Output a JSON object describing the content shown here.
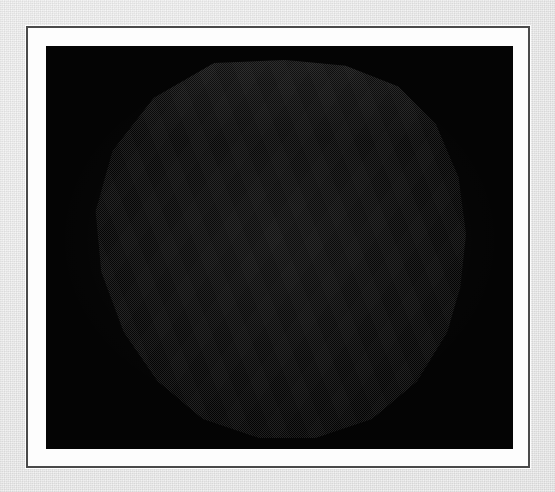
{
  "page": {
    "background_color": "#e9e9e9",
    "medium": "scanned paper plate"
  },
  "plate": {
    "frame_color": "#4a4a4a",
    "matte_color": "#fdfdfd",
    "panel_color": "#040404",
    "frame_rect": {
      "x": 26,
      "y": 26,
      "width": 504,
      "height": 442
    },
    "matte_width_px": 16,
    "image_rect": {
      "x": 44,
      "y": 44,
      "width": 467,
      "height": 403
    }
  },
  "figure": {
    "silhouette": "polygonal (approx. decagonal) outline from a low-resolution tessellated mesh",
    "rendering": "grayscale diffuse shading with ordered dither / halftone raster texture",
    "background": "black field",
    "light_direction": "upper-left of center",
    "highlight_center": {
      "x_pct": 44,
      "y_pct": 40
    },
    "tone_range": {
      "brightest": "#d8d8d8",
      "mid": "#a8a8a8",
      "limb": "#545454",
      "field": "#040404"
    },
    "bounds_in_panel": {
      "x": 44,
      "y": 14,
      "width": 376,
      "height": 378
    }
  },
  "caption": {
    "text": ""
  }
}
